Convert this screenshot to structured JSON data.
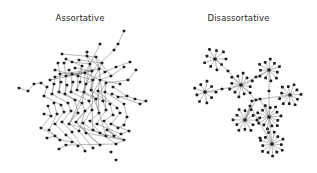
{
  "left": {
    "title": "Assortative",
    "nodes": [
      [
        124,
        31
      ],
      [
        118,
        44
      ],
      [
        114,
        50
      ],
      [
        100,
        44
      ],
      [
        87,
        52
      ],
      [
        62,
        54
      ],
      [
        66,
        59
      ],
      [
        72,
        62
      ],
      [
        79,
        60
      ],
      [
        87,
        56
      ],
      [
        96,
        57
      ],
      [
        102,
        63
      ],
      [
        90,
        64
      ],
      [
        82,
        66
      ],
      [
        75,
        68
      ],
      [
        69,
        70
      ],
      [
        64,
        63
      ],
      [
        58,
        63
      ],
      [
        55,
        70
      ],
      [
        50,
        80
      ],
      [
        55,
        77
      ],
      [
        60,
        74
      ],
      [
        66,
        76
      ],
      [
        72,
        74
      ],
      [
        78,
        76
      ],
      [
        85,
        73
      ],
      [
        92,
        71
      ],
      [
        99,
        69
      ],
      [
        105,
        72
      ],
      [
        111,
        76
      ],
      [
        116,
        67
      ],
      [
        124,
        67
      ],
      [
        130,
        62
      ],
      [
        136,
        70
      ],
      [
        128,
        80
      ],
      [
        120,
        84
      ],
      [
        113,
        87
      ],
      [
        106,
        83
      ],
      [
        100,
        80
      ],
      [
        93,
        80
      ],
      [
        86,
        84
      ],
      [
        80,
        82
      ],
      [
        73,
        82
      ],
      [
        67,
        85
      ],
      [
        61,
        82
      ],
      [
        54,
        84
      ],
      [
        47,
        87
      ],
      [
        41,
        83
      ],
      [
        34,
        84
      ],
      [
        28,
        91
      ],
      [
        19,
        88
      ],
      [
        44,
        96
      ],
      [
        52,
        94
      ],
      [
        59,
        92
      ],
      [
        65,
        94
      ],
      [
        71,
        92
      ],
      [
        77,
        90
      ],
      [
        84,
        92
      ],
      [
        91,
        90
      ],
      [
        98,
        91
      ],
      [
        105,
        92
      ],
      [
        112,
        94
      ],
      [
        118,
        97
      ],
      [
        127,
        96
      ],
      [
        135,
        99
      ],
      [
        146,
        101
      ],
      [
        140,
        104
      ],
      [
        124,
        104
      ],
      [
        117,
        108
      ],
      [
        110,
        104
      ],
      [
        103,
        101
      ],
      [
        96,
        99
      ],
      [
        89,
        101
      ],
      [
        82,
        103
      ],
      [
        75,
        100
      ],
      [
        68,
        103
      ],
      [
        61,
        105
      ],
      [
        54,
        103
      ],
      [
        48,
        106
      ],
      [
        44,
        114
      ],
      [
        51,
        116
      ],
      [
        57,
        114
      ],
      [
        64,
        112
      ],
      [
        71,
        111
      ],
      [
        78,
        113
      ],
      [
        85,
        111
      ],
      [
        92,
        110
      ],
      [
        99,
        113
      ],
      [
        106,
        110
      ],
      [
        113,
        115
      ],
      [
        120,
        113
      ],
      [
        127,
        117
      ],
      [
        124,
        125
      ],
      [
        118,
        128
      ],
      [
        111,
        124
      ],
      [
        104,
        121
      ],
      [
        97,
        124
      ],
      [
        90,
        121
      ],
      [
        83,
        123
      ],
      [
        76,
        122
      ],
      [
        69,
        124
      ],
      [
        62,
        122
      ],
      [
        55,
        124
      ],
      [
        49,
        130
      ],
      [
        41,
        128
      ],
      [
        47,
        138
      ],
      [
        55,
        136
      ],
      [
        60,
        140
      ],
      [
        66,
        135
      ],
      [
        72,
        132
      ],
      [
        79,
        131
      ],
      [
        86,
        133
      ],
      [
        93,
        130
      ],
      [
        100,
        133
      ],
      [
        107,
        130
      ],
      [
        114,
        136
      ],
      [
        121,
        134
      ],
      [
        129,
        131
      ],
      [
        124,
        140
      ],
      [
        116,
        144
      ],
      [
        106,
        136
      ],
      [
        100,
        145
      ],
      [
        93,
        148
      ],
      [
        85,
        151
      ],
      [
        78,
        146
      ],
      [
        72,
        142
      ],
      [
        66,
        145
      ],
      [
        59,
        149
      ],
      [
        111,
        152
      ],
      [
        116,
        160
      ]
    ],
    "edges": [
      [
        0,
        1
      ],
      [
        1,
        2
      ],
      [
        2,
        26
      ],
      [
        3,
        12
      ],
      [
        4,
        9
      ],
      [
        5,
        10
      ],
      [
        6,
        13
      ],
      [
        7,
        12
      ],
      [
        8,
        11
      ],
      [
        9,
        26
      ],
      [
        10,
        27
      ],
      [
        11,
        27
      ],
      [
        12,
        25
      ],
      [
        13,
        24
      ],
      [
        14,
        26
      ],
      [
        15,
        23
      ],
      [
        16,
        22
      ],
      [
        17,
        21
      ],
      [
        18,
        24
      ],
      [
        19,
        25
      ],
      [
        20,
        26
      ],
      [
        21,
        27
      ],
      [
        22,
        25
      ],
      [
        23,
        26
      ],
      [
        24,
        39
      ],
      [
        25,
        38
      ],
      [
        26,
        40
      ],
      [
        27,
        39
      ],
      [
        28,
        40
      ],
      [
        29,
        38
      ],
      [
        30,
        28
      ],
      [
        31,
        29
      ],
      [
        32,
        30
      ],
      [
        33,
        34
      ],
      [
        34,
        37
      ],
      [
        35,
        38
      ],
      [
        36,
        63
      ],
      [
        37,
        60
      ],
      [
        38,
        59
      ],
      [
        39,
        58
      ],
      [
        40,
        57
      ],
      [
        41,
        56
      ],
      [
        42,
        55
      ],
      [
        43,
        54
      ],
      [
        44,
        53
      ],
      [
        45,
        52
      ],
      [
        46,
        51
      ],
      [
        47,
        46
      ],
      [
        48,
        47
      ],
      [
        49,
        48
      ],
      [
        50,
        49
      ],
      [
        51,
        76
      ],
      [
        52,
        75
      ],
      [
        53,
        74
      ],
      [
        54,
        73
      ],
      [
        55,
        72
      ],
      [
        56,
        71
      ],
      [
        57,
        70
      ],
      [
        58,
        69
      ],
      [
        59,
        68
      ],
      [
        60,
        67
      ],
      [
        61,
        66
      ],
      [
        62,
        63
      ],
      [
        63,
        64
      ],
      [
        64,
        65
      ],
      [
        65,
        66
      ],
      [
        67,
        91
      ],
      [
        68,
        90
      ],
      [
        69,
        89
      ],
      [
        70,
        88
      ],
      [
        71,
        87
      ],
      [
        72,
        86
      ],
      [
        73,
        85
      ],
      [
        74,
        84
      ],
      [
        75,
        83
      ],
      [
        76,
        82
      ],
      [
        77,
        81
      ],
      [
        78,
        80
      ],
      [
        79,
        80
      ],
      [
        80,
        104
      ],
      [
        81,
        103
      ],
      [
        82,
        102
      ],
      [
        83,
        101
      ],
      [
        84,
        100
      ],
      [
        85,
        99
      ],
      [
        86,
        98
      ],
      [
        87,
        97
      ],
      [
        88,
        96
      ],
      [
        89,
        95
      ],
      [
        90,
        94
      ],
      [
        91,
        92
      ],
      [
        92,
        93
      ],
      [
        93,
        94
      ],
      [
        94,
        117
      ],
      [
        95,
        115
      ],
      [
        96,
        116
      ],
      [
        97,
        113
      ],
      [
        98,
        112
      ],
      [
        99,
        111
      ],
      [
        100,
        110
      ],
      [
        101,
        109
      ],
      [
        102,
        108
      ],
      [
        103,
        107
      ],
      [
        104,
        106
      ],
      [
        105,
        106
      ],
      [
        106,
        107
      ],
      [
        107,
        125
      ],
      [
        108,
        124
      ],
      [
        109,
        123
      ],
      [
        110,
        122
      ],
      [
        111,
        121
      ],
      [
        112,
        120
      ],
      [
        113,
        119
      ],
      [
        114,
        118
      ],
      [
        116,
        117
      ],
      [
        118,
        119
      ],
      [
        119,
        126
      ],
      [
        126,
        127
      ],
      [
        115,
        114
      ],
      [
        26,
        58
      ],
      [
        25,
        57
      ],
      [
        27,
        70
      ],
      [
        40,
        73
      ],
      [
        39,
        86
      ],
      [
        58,
        87
      ],
      [
        57,
        100
      ],
      [
        71,
        99
      ],
      [
        86,
        112
      ],
      [
        98,
        111
      ],
      [
        12,
        40
      ],
      [
        13,
        41
      ],
      [
        9,
        28
      ],
      [
        10,
        29
      ],
      [
        24,
        56
      ],
      [
        23,
        55
      ],
      [
        22,
        54
      ],
      [
        21,
        53
      ],
      [
        20,
        52
      ],
      [
        38,
        72
      ],
      [
        37,
        71
      ],
      [
        60,
        88
      ],
      [
        59,
        87
      ],
      [
        73,
        100
      ],
      [
        85,
        110
      ],
      [
        99,
        121
      ],
      [
        87,
        120
      ],
      [
        111,
        118
      ],
      [
        100,
        118
      ]
    ]
  },
  "right": {
    "title": "Disassortative",
    "hubs": [
      {
        "cx": 55,
        "cy": 59,
        "leaves": 9,
        "r": 11
      },
      {
        "cx": 81,
        "cy": 85,
        "leaves": 12,
        "r": 12
      },
      {
        "cx": 109,
        "cy": 70,
        "leaves": 11,
        "r": 11
      },
      {
        "cx": 45,
        "cy": 92,
        "leaves": 9,
        "r": 11
      },
      {
        "cx": 130,
        "cy": 95,
        "leaves": 11,
        "r": 11
      },
      {
        "cx": 109,
        "cy": 117,
        "leaves": 14,
        "r": 12
      },
      {
        "cx": 85,
        "cy": 120,
        "leaves": 12,
        "r": 12
      },
      {
        "cx": 112,
        "cy": 144,
        "leaves": 13,
        "r": 12
      }
    ],
    "connectors": [
      [
        68,
        71
      ],
      [
        62,
        89
      ],
      [
        96,
        77
      ],
      [
        109,
        91
      ],
      [
        96,
        100
      ],
      [
        100,
        99
      ],
      [
        90,
        106
      ],
      [
        100,
        138
      ],
      [
        92,
        101
      ]
    ],
    "hub_links": [
      [
        0,
        "c0"
      ],
      [
        "c0",
        1
      ],
      [
        3,
        "c1"
      ],
      [
        "c1",
        1
      ],
      [
        1,
        "c2"
      ],
      [
        "c2",
        2
      ],
      [
        2,
        "c3"
      ],
      [
        "c3",
        5
      ],
      [
        1,
        "c4"
      ],
      [
        "c4",
        "c5"
      ],
      [
        "c5",
        4
      ],
      [
        "c4",
        6
      ],
      [
        "c5",
        5
      ],
      [
        6,
        "c6"
      ],
      [
        "c6",
        7
      ],
      [
        5,
        7
      ],
      [
        "c4",
        "c8"
      ],
      [
        "c8",
        6
      ]
    ]
  }
}
